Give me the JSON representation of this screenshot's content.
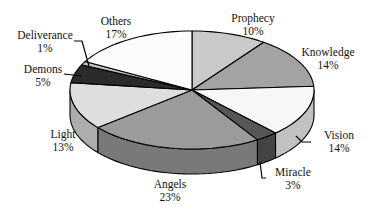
{
  "chart_data": {
    "type": "pie",
    "variant": "3d",
    "title": "",
    "start_angle_deg": 0,
    "direction": "clockwise",
    "slices": [
      {
        "label": "Prophecy",
        "value": 10,
        "pct_label": "10%",
        "color": "#c9c9c9"
      },
      {
        "label": "Knowledge",
        "value": 14,
        "pct_label": "14%",
        "color": "#a3a3a3"
      },
      {
        "label": "Vision",
        "value": 14,
        "pct_label": "14%",
        "color": "#f7f7f7"
      },
      {
        "label": "Miracle",
        "value": 3,
        "pct_label": "3%",
        "color": "#575757"
      },
      {
        "label": "Angels",
        "value": 23,
        "pct_label": "23%",
        "color": "#9b9b9b"
      },
      {
        "label": "Light",
        "value": 13,
        "pct_label": "13%",
        "color": "#dedede"
      },
      {
        "label": "Demons",
        "value": 5,
        "pct_label": "5%",
        "color": "#2b2b2b"
      },
      {
        "label": "Deliverance",
        "value": 1,
        "pct_label": "1%",
        "color": "#c2c2c2"
      },
      {
        "label": "Others",
        "value": 17,
        "pct_label": "17%",
        "color": "#fbfbfb"
      }
    ],
    "legend": "none",
    "data_labels": "category and percentage, outside"
  },
  "labels": {
    "prophecy": {
      "name": "Prophecy",
      "pct": "10%"
    },
    "knowledge": {
      "name": "Knowledge",
      "pct": "14%"
    },
    "vision": {
      "name": "Vision",
      "pct": "14%"
    },
    "miracle": {
      "name": "Miracle",
      "pct": "3%"
    },
    "angels": {
      "name": "Angels",
      "pct": "23%"
    },
    "light": {
      "name": "Light",
      "pct": "13%"
    },
    "demons": {
      "name": "Demons",
      "pct": "5%"
    },
    "deliverance": {
      "name": "Deliverance",
      "pct": "1%"
    },
    "others": {
      "name": "Others",
      "pct": "17%"
    }
  }
}
